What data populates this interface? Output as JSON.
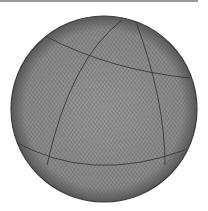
{
  "figure": {
    "center": [
      104,
      109
    ],
    "radius": 93,
    "colors": {
      "background": "#ffffff",
      "sphere_fill": "#8c8c8c",
      "mesh_line": "#5a5a5a",
      "edge": "#3c3c3c",
      "topbar": "#9a9a9a"
    }
  }
}
